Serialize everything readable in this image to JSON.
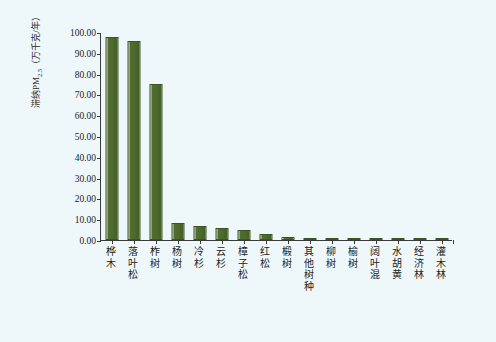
{
  "chart_data": {
    "type": "bar",
    "title": "",
    "xlabel": "",
    "ylabel": "滞纳PM2.5（万千克/年）",
    "ylabel_main": "滞纳PM",
    "ylabel_sub": "2.5",
    "ylabel_unit": "（万千克/年）",
    "ylim": [
      0,
      100
    ],
    "ytick_labels": [
      "0.00",
      "10.00",
      "20.00",
      "30.00",
      "40.00",
      "50.00",
      "60.00",
      "70.00",
      "80.00",
      "90.00",
      "100.00"
    ],
    "ytick_values": [
      0,
      10,
      20,
      30,
      40,
      50,
      60,
      70,
      80,
      90,
      100
    ],
    "grid": false,
    "legend": false,
    "bar_color": "#4d692c",
    "background_color": "#eef7fa",
    "axis_color": "#3a3a3a",
    "categories": [
      "桦木",
      "落叶松",
      "柞树",
      "杨树",
      "冷杉",
      "云杉",
      "樟子松",
      "红松",
      "椴树",
      "其他树种",
      "柳树",
      "榆树",
      "阔叶混",
      "水胡黄",
      "经济林",
      "灌木林"
    ],
    "values": [
      97.5,
      95.8,
      75.2,
      8.3,
      6.6,
      5.6,
      4.6,
      3.1,
      1.5,
      1.0,
      1.0,
      0.9,
      0.9,
      0.8,
      0.8,
      0.8
    ]
  }
}
